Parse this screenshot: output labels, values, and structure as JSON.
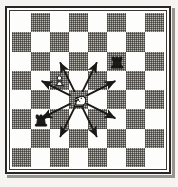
{
  "figure": {
    "description": "Chess diagram: a white knight on d4 with arrows to all eight knight-move squares",
    "border_color": "#2a2723",
    "light_square_color": "#fdfdfb",
    "dark_square_color": "#b9b7b2",
    "arrow_color": "#1b1916",
    "paper_color": "#f6f4f0"
  },
  "board": {
    "files": [
      "a",
      "b",
      "c",
      "d",
      "e",
      "f",
      "g",
      "h"
    ],
    "ranks": [
      "8",
      "7",
      "6",
      "5",
      "4",
      "3",
      "2",
      "1"
    ],
    "rows": 8,
    "columns": 8,
    "orientation": "white-bottom",
    "top_left_square_color": "light"
  },
  "pieces": [
    {
      "id": "white-knight",
      "name": "knight-white",
      "glyph": "♘",
      "color": "white",
      "type": "knight",
      "col": 3,
      "row": 4,
      "label": "White knight"
    },
    {
      "id": "white-pawn",
      "name": "pawn-white",
      "glyph": "♙",
      "color": "white",
      "type": "pawn",
      "col": 2,
      "row": 3,
      "label": "White pawn"
    },
    {
      "id": "black-rook-top",
      "name": "rook-black-top",
      "glyph": "♜",
      "color": "black",
      "type": "rook",
      "col": 5,
      "row": 2,
      "label": "Black rook"
    },
    {
      "id": "black-rook-left",
      "name": "rook-black-left",
      "glyph": "♜",
      "color": "black",
      "type": "rook",
      "col": 1,
      "row": 5,
      "label": "Black rook"
    }
  ],
  "arrows": {
    "origin": {
      "col": 3,
      "row": 4,
      "label": "d4"
    },
    "color": "#1b1916",
    "count": 8,
    "targets": [
      {
        "name": "arrow-up-left",
        "col": 2,
        "row": 2,
        "label": "c6"
      },
      {
        "name": "arrow-up-right",
        "col": 4,
        "row": 2,
        "label": "e6"
      },
      {
        "name": "arrow-left-up",
        "col": 1,
        "row": 3,
        "label": "b5"
      },
      {
        "name": "arrow-right-up",
        "col": 5,
        "row": 3,
        "label": "f5"
      },
      {
        "name": "arrow-left-down",
        "col": 1,
        "row": 5,
        "label": "b3"
      },
      {
        "name": "arrow-right-down",
        "col": 5,
        "row": 5,
        "label": "f3"
      },
      {
        "name": "arrow-down-left",
        "col": 2,
        "row": 6,
        "label": "c2"
      },
      {
        "name": "arrow-down-right",
        "col": 4,
        "row": 6,
        "label": "e2"
      }
    ]
  }
}
